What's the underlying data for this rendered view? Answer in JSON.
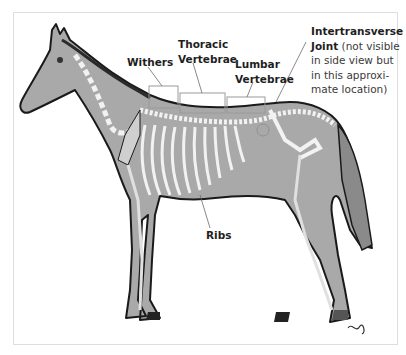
{
  "figure": {
    "colors": {
      "body_fill": "#a9a9a9",
      "outline": "#1a1a1a",
      "bone": "#f2f2f2",
      "label_box": "#9a9a9a",
      "text": "#1e1e1e",
      "background": "#ffffff"
    }
  },
  "labels": {
    "withers": "Withers",
    "thoracic_line1": "Thoracic",
    "thoracic_line2": "Vertebrae",
    "lumbar_line1": "Lumbar",
    "lumbar_line2": "Vertebrae",
    "ribs": "Ribs",
    "intertransverse_title": "Intertransverse",
    "intertransverse_line2_bold": "Joint",
    "intertransverse_line2_rest": " (not visible",
    "intertransverse_line3": "in side view but",
    "intertransverse_line4": "in this approxi-",
    "intertransverse_line5": "mate location)"
  },
  "signature": "artist-signature"
}
